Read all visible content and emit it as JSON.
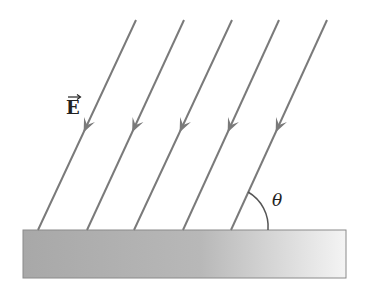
{
  "diagram": {
    "field_label": "E",
    "angle_label": "θ",
    "line_color": "#7a7a7a",
    "slab_color_dark": "#9a9a9a",
    "slab_color_light": "#f2f2f2",
    "field_lines": [
      {
        "x1": 136,
        "y1": 20,
        "x2": 38,
        "y2": 230
      },
      {
        "x1": 184,
        "y1": 20,
        "x2": 87,
        "y2": 230
      },
      {
        "x1": 232,
        "y1": 20,
        "x2": 134,
        "y2": 230
      },
      {
        "x1": 279,
        "y1": 20,
        "x2": 183,
        "y2": 230
      },
      {
        "x1": 327,
        "y1": 20,
        "x2": 231,
        "y2": 230
      }
    ]
  }
}
